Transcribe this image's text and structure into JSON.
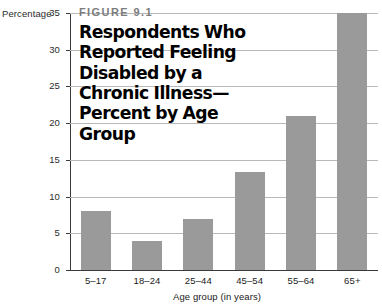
{
  "figure": {
    "number_label": "FIGURE 9.1",
    "title": "Respondents Who Reported Feeling Disabled by a Chronic Illness—Percent by Age Group"
  },
  "colors": {
    "bar_fill": "#9a9a9a",
    "gridline": "#b9b9b9",
    "axis": "#3a3a3a",
    "figure_number_text": "#7d7d7d",
    "title_text": "#000000",
    "background": "#ffffff"
  },
  "chart_data": {
    "type": "bar",
    "title": "Respondents Who Reported Feeling Disabled by a Chronic Illness—Percent by Age Group",
    "subtitle": "FIGURE 9.1",
    "categories": [
      "5–17",
      "18–24",
      "25–44",
      "45–54",
      "55–64",
      "65+"
    ],
    "values": [
      8,
      4,
      7,
      13.3,
      21,
      35
    ],
    "xlabel": "Age group (in years)",
    "ylabel": "Percentage",
    "ylim": [
      0,
      35
    ],
    "yticks": [
      0,
      5,
      10,
      15,
      20,
      25,
      30,
      35
    ],
    "ytick_labels": [
      "0",
      "5",
      "10",
      "15",
      "20",
      "25",
      "30",
      "35"
    ],
    "grid": true,
    "grid_axis": "y",
    "legend": false
  }
}
